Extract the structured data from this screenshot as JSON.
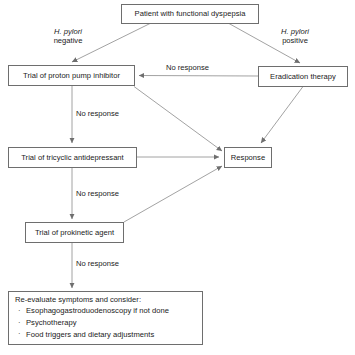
{
  "diagram": {
    "type": "flowchart",
    "stroke_color": "#6e6e6e",
    "text_color": "#1a1a1a",
    "background": "#ffffff"
  },
  "nodes": {
    "patient": "Patient with functional dyspepsia",
    "ppi": "Trial of proton pump inhibitor",
    "eradication": "Eradication therapy",
    "tricyclic": "Trial of tricyclic antidepressant",
    "prokinetic": "Trial of prokinetic agent",
    "response": "Response",
    "reevaluate_title": "Re-evaluate symptoms and consider:",
    "reevaluate_items": [
      "Esophagogastroduodenoscopy if not done",
      "Psychotherapy",
      "Food triggers and dietary adjustments"
    ],
    "bullet_glyph": "·"
  },
  "edge_labels": {
    "hp_negative_species": "H. pylori",
    "hp_negative_status": "negative",
    "hp_positive_species": "H. pylori",
    "hp_positive_status": "positive",
    "no_response_eradication": "No response",
    "no_response_ppi": "No response",
    "no_response_tricyclic": "No response",
    "no_response_prokinetic": "No response"
  }
}
